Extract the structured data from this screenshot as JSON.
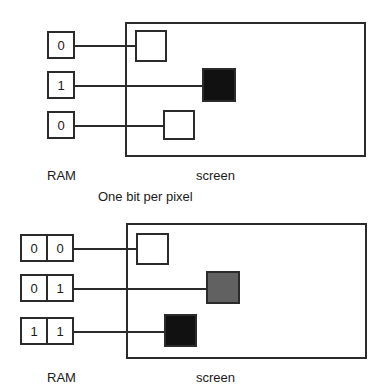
{
  "figure": {
    "background_color": "#ffffff",
    "stroke_color": "#2b2b2b",
    "caption": "One bit per pixel"
  },
  "diagrams": [
    {
      "id": "one-bit-per-pixel",
      "ram_label": "RAM",
      "screen_label": "screen",
      "bits_per_pixel": 1,
      "ram_words": [
        {
          "cells": [
            "0"
          ]
        },
        {
          "cells": [
            "1"
          ]
        },
        {
          "cells": [
            "0"
          ]
        }
      ],
      "pixels": [
        {
          "value": "0",
          "fill": "#ffffff"
        },
        {
          "value": "1",
          "fill": "#111111"
        },
        {
          "value": "0",
          "fill": "#ffffff"
        }
      ]
    },
    {
      "id": "two-bits-per-pixel",
      "ram_label": "RAM",
      "screen_label": "screen",
      "bits_per_pixel": 2,
      "ram_words": [
        {
          "cells": [
            "0",
            "0"
          ]
        },
        {
          "cells": [
            "0",
            "1"
          ]
        },
        {
          "cells": [
            "1",
            "1"
          ]
        }
      ],
      "pixels": [
        {
          "value": "00",
          "fill": "#ffffff"
        },
        {
          "value": "01",
          "fill": "#616161"
        },
        {
          "value": "11",
          "fill": "#111111"
        }
      ]
    }
  ]
}
